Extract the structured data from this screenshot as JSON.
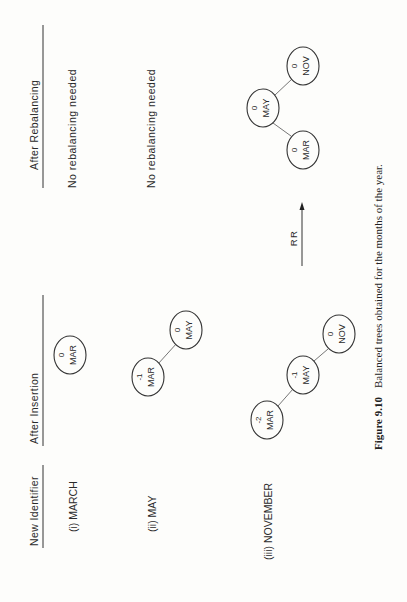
{
  "headers": {
    "new_identifier": "New Identifier",
    "after_insertion": "After Insertion",
    "after_rebalancing": "After Rebalancing"
  },
  "rows": [
    {
      "label": "(i) MARCH",
      "after_insertion": {
        "nodes": [
          {
            "id": "MAR",
            "balance": "0"
          }
        ],
        "edges": []
      },
      "after_rebalancing": {
        "text": "No rebalancing needed"
      }
    },
    {
      "label": "(ii) MAY",
      "after_insertion": {
        "nodes": [
          {
            "id": "MAR",
            "balance": "-1"
          },
          {
            "id": "MAY",
            "balance": "0"
          }
        ],
        "edges": [
          [
            "MAR",
            "MAY"
          ]
        ]
      },
      "after_rebalancing": {
        "text": "No rebalancing needed"
      }
    },
    {
      "label": "(iii) NOVEMBER",
      "after_insertion": {
        "nodes": [
          {
            "id": "MAR",
            "balance": "-2"
          },
          {
            "id": "MAY",
            "balance": "-1"
          },
          {
            "id": "NOV",
            "balance": "0"
          }
        ],
        "edges": [
          [
            "MAR",
            "MAY"
          ],
          [
            "MAY",
            "NOV"
          ]
        ]
      },
      "rotation": "RR",
      "after_rebalancing": {
        "nodes": [
          {
            "id": "MAY",
            "balance": "0"
          },
          {
            "id": "MAR",
            "balance": "0"
          },
          {
            "id": "NOV",
            "balance": "0"
          }
        ],
        "edges": [
          [
            "MAY",
            "MAR"
          ],
          [
            "MAY",
            "NOV"
          ]
        ]
      }
    }
  ],
  "caption": {
    "figure_label": "Figure 9.10",
    "text": "Balanced trees obtained for the months of the year."
  }
}
